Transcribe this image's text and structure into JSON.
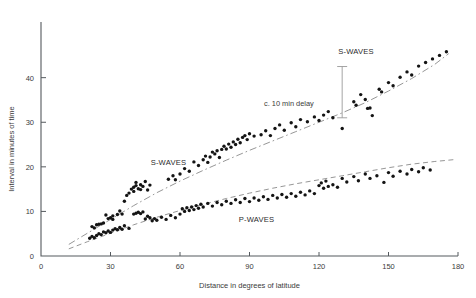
{
  "chart_data": {
    "type": "scatter",
    "title": "",
    "xlabel": "Distance in degrees of latitude",
    "ylabel": "Interval in minutes of time",
    "xlim": [
      0,
      180
    ],
    "ylim": [
      0,
      48
    ],
    "xticks": [
      0,
      30,
      60,
      90,
      120,
      150,
      180
    ],
    "xtick_labels": [
      "0",
      "30",
      "60",
      "90",
      "120",
      "150",
      "180"
    ],
    "yticks": [
      0,
      10,
      20,
      30,
      40
    ],
    "ytick_labels": [
      "0",
      "10",
      "20",
      "30",
      "40"
    ],
    "grid": false,
    "legend_position": "inline-annotation",
    "annotations": [
      {
        "name": "s-waves-label-left",
        "text": "S-WAVES",
        "x": 55,
        "y": 20.4
      },
      {
        "name": "s-waves-label-right",
        "text": "S-WAVES",
        "x": 136,
        "y": 45.3
      },
      {
        "name": "p-waves-label",
        "text": "P-WAVES",
        "x": 93,
        "y": 7.6
      },
      {
        "name": "delay-label",
        "text": "c. 10 min delay",
        "x": 107,
        "y": 33.6
      }
    ],
    "delay_marker": {
      "label": "c. 10 min delay",
      "x": 130,
      "y_top": 42.5,
      "y_bottom": 31.0
    },
    "series": [
      {
        "name": "S-WAVES",
        "marker": "filled-circle",
        "trend_style": "dash-dot",
        "trend_points": [
          [
            12,
            2.6
          ],
          [
            20,
            5.1
          ],
          [
            30,
            8.2
          ],
          [
            40,
            11.3
          ],
          [
            50,
            14.2
          ],
          [
            60,
            16.8
          ],
          [
            70,
            19.2
          ],
          [
            80,
            21.5
          ],
          [
            90,
            23.7
          ],
          [
            100,
            25.8
          ],
          [
            110,
            27.9
          ],
          [
            120,
            30.0
          ],
          [
            130,
            32.1
          ],
          [
            140,
            34.4
          ],
          [
            150,
            37.0
          ],
          [
            160,
            39.8
          ],
          [
            170,
            43.0
          ],
          [
            176,
            45.4
          ]
        ],
        "points": [
          [
            22,
            6.6
          ],
          [
            23,
            6.3
          ],
          [
            24,
            7.0
          ],
          [
            25,
            7.1
          ],
          [
            26,
            7.2
          ],
          [
            27,
            7.4
          ],
          [
            28,
            9.2
          ],
          [
            29,
            8.4
          ],
          [
            30,
            8.6
          ],
          [
            31,
            9.0
          ],
          [
            31,
            8.2
          ],
          [
            33,
            9.3
          ],
          [
            34,
            10.1
          ],
          [
            35,
            9.4
          ],
          [
            36,
            12.3
          ],
          [
            37,
            13.6
          ],
          [
            38,
            14.1
          ],
          [
            39,
            15.0
          ],
          [
            40,
            15.4
          ],
          [
            40,
            14.5
          ],
          [
            41,
            15.8
          ],
          [
            41,
            16.5
          ],
          [
            42,
            15.1
          ],
          [
            43,
            16.0
          ],
          [
            43,
            14.9
          ],
          [
            44,
            15.6
          ],
          [
            45,
            16.7
          ],
          [
            46,
            14.8
          ],
          [
            47,
            15.9
          ],
          [
            55,
            17.2
          ],
          [
            57,
            18.0
          ],
          [
            58,
            17.1
          ],
          [
            60,
            18.4
          ],
          [
            62,
            19.6
          ],
          [
            64,
            19.0
          ],
          [
            66,
            21.1
          ],
          [
            68,
            20.3
          ],
          [
            70,
            21.6
          ],
          [
            71,
            22.4
          ],
          [
            72,
            21.0
          ],
          [
            73,
            22.2
          ],
          [
            74,
            23.3
          ],
          [
            75,
            22.9
          ],
          [
            76,
            23.6
          ],
          [
            77,
            22.1
          ],
          [
            78,
            23.9
          ],
          [
            79,
            24.6
          ],
          [
            80,
            24.0
          ],
          [
            81,
            25.1
          ],
          [
            82,
            24.4
          ],
          [
            83,
            25.6
          ],
          [
            84,
            25.0
          ],
          [
            85,
            26.2
          ],
          [
            86,
            25.4
          ],
          [
            87,
            26.6
          ],
          [
            88,
            27.0
          ],
          [
            89,
            26.1
          ],
          [
            90,
            27.4
          ],
          [
            92,
            26.9
          ],
          [
            95,
            27.2
          ],
          [
            97,
            28.1
          ],
          [
            99,
            27.0
          ],
          [
            101,
            28.6
          ],
          [
            103,
            29.4
          ],
          [
            105,
            28.2
          ],
          [
            108,
            29.9
          ],
          [
            110,
            29.0
          ],
          [
            112,
            30.6
          ],
          [
            115,
            30.1
          ],
          [
            118,
            31.2
          ],
          [
            120,
            30.4
          ],
          [
            122,
            31.6
          ],
          [
            124,
            32.4
          ],
          [
            126,
            31.0
          ],
          [
            130,
            28.6
          ],
          [
            135,
            34.6
          ],
          [
            136,
            33.8
          ],
          [
            138,
            36.2
          ],
          [
            140,
            35.1
          ],
          [
            141,
            33.1
          ],
          [
            142,
            33.2
          ],
          [
            143,
            31.5
          ],
          [
            146,
            37.4
          ],
          [
            147,
            36.8
          ],
          [
            150,
            38.9
          ],
          [
            152,
            38.2
          ],
          [
            155,
            40.1
          ],
          [
            158,
            41.3
          ],
          [
            160,
            40.6
          ],
          [
            163,
            42.6
          ],
          [
            166,
            43.4
          ],
          [
            169,
            44.2
          ],
          [
            172,
            45.0
          ],
          [
            175,
            45.8
          ]
        ]
      },
      {
        "name": "P-WAVES",
        "marker": "filled-circle",
        "trend_style": "dashed",
        "trend_points": [
          [
            12,
            1.6
          ],
          [
            20,
            3.2
          ],
          [
            30,
            5.1
          ],
          [
            40,
            7.0
          ],
          [
            50,
            8.7
          ],
          [
            60,
            10.2
          ],
          [
            70,
            11.6
          ],
          [
            80,
            12.9
          ],
          [
            90,
            14.1
          ],
          [
            100,
            15.2
          ],
          [
            110,
            16.2
          ],
          [
            120,
            17.1
          ],
          [
            130,
            18.0
          ],
          [
            140,
            18.9
          ],
          [
            150,
            19.8
          ],
          [
            160,
            20.6
          ],
          [
            170,
            21.2
          ],
          [
            178,
            21.6
          ]
        ],
        "points": [
          [
            21,
            4.0
          ],
          [
            22,
            4.4
          ],
          [
            23,
            4.1
          ],
          [
            24,
            4.6
          ],
          [
            25,
            5.0
          ],
          [
            26,
            4.8
          ],
          [
            27,
            5.4
          ],
          [
            28,
            5.2
          ],
          [
            29,
            5.6
          ],
          [
            30,
            5.3
          ],
          [
            31,
            5.8
          ],
          [
            32,
            6.1
          ],
          [
            33,
            5.9
          ],
          [
            34,
            6.4
          ],
          [
            35,
            6.0
          ],
          [
            36,
            6.8
          ],
          [
            38,
            6.2
          ],
          [
            40,
            9.4
          ],
          [
            41,
            9.6
          ],
          [
            42,
            9.8
          ],
          [
            43,
            9.5
          ],
          [
            44,
            9.9
          ],
          [
            45,
            8.3
          ],
          [
            46,
            8.9
          ],
          [
            47,
            8.6
          ],
          [
            48,
            7.9
          ],
          [
            49,
            8.4
          ],
          [
            50,
            8.0
          ],
          [
            52,
            8.7
          ],
          [
            54,
            8.2
          ],
          [
            56,
            9.1
          ],
          [
            58,
            8.6
          ],
          [
            60,
            9.4
          ],
          [
            61,
            10.6
          ],
          [
            62,
            10.0
          ],
          [
            63,
            10.8
          ],
          [
            64,
            10.2
          ],
          [
            65,
            11.0
          ],
          [
            66,
            10.4
          ],
          [
            67,
            11.3
          ],
          [
            68,
            10.7
          ],
          [
            69,
            11.6
          ],
          [
            70,
            11.0
          ],
          [
            72,
            11.8
          ],
          [
            74,
            11.2
          ],
          [
            76,
            12.0
          ],
          [
            78,
            11.5
          ],
          [
            80,
            12.3
          ],
          [
            82,
            11.8
          ],
          [
            84,
            12.6
          ],
          [
            86,
            12.0
          ],
          [
            88,
            12.9
          ],
          [
            90,
            12.2
          ],
          [
            92,
            13.0
          ],
          [
            94,
            12.5
          ],
          [
            96,
            13.3
          ],
          [
            98,
            12.7
          ],
          [
            100,
            13.6
          ],
          [
            102,
            13.0
          ],
          [
            104,
            13.8
          ],
          [
            106,
            13.2
          ],
          [
            108,
            14.0
          ],
          [
            110,
            13.4
          ],
          [
            112,
            14.3
          ],
          [
            114,
            13.7
          ],
          [
            116,
            14.6
          ],
          [
            118,
            14.0
          ],
          [
            120,
            15.8
          ],
          [
            121,
            16.4
          ],
          [
            122,
            15.2
          ],
          [
            123,
            16.8
          ],
          [
            124,
            15.6
          ],
          [
            126,
            16.0
          ],
          [
            128,
            15.4
          ],
          [
            130,
            17.4
          ],
          [
            132,
            16.6
          ],
          [
            135,
            17.8
          ],
          [
            137,
            16.9
          ],
          [
            140,
            18.4
          ],
          [
            142,
            17.4
          ],
          [
            145,
            18.0
          ],
          [
            148,
            16.5
          ],
          [
            150,
            18.7
          ],
          [
            152,
            17.9
          ],
          [
            155,
            19.0
          ],
          [
            158,
            18.4
          ],
          [
            160,
            19.4
          ],
          [
            163,
            18.9
          ],
          [
            165,
            19.8
          ],
          [
            168,
            19.3
          ]
        ]
      }
    ]
  },
  "figure": {
    "background": "#ffffff",
    "dot_color": "#141414",
    "trend_color": "#8a8a8a",
    "axis_color": "#555a5e"
  }
}
